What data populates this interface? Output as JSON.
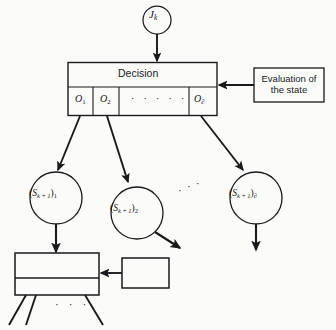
{
  "diagram": {
    "background_color": "#fbfbfa",
    "stroke_color": "#1a1a1d",
    "nodes": {
      "cost_node": {
        "label_base": "J",
        "label_sub": "k",
        "shape": "circle",
        "cx": 157,
        "cy": 20,
        "r": 14
      },
      "decision_box": {
        "header_label": "Decision",
        "cells": [
          {
            "base": "O",
            "sub": "1"
          },
          {
            "base": "O",
            "sub": "2"
          },
          {
            "base": "O",
            "sub": "∂"
          }
        ],
        "cells_ellipsis": "· · · · ·"
      },
      "evaluation_box": {
        "line1": "Evaluation of",
        "line2": "the state"
      },
      "state_nodes": [
        {
          "prefix": "(",
          "base": "S",
          "sub_inner": "k + 1",
          "close": ")",
          "sub_outer": "1"
        },
        {
          "prefix": "(",
          "base": "S",
          "sub_inner": "k + 1",
          "close": ")",
          "sub_outer": "2"
        },
        {
          "prefix": "(",
          "base": "S",
          "sub_inner": "k + 1",
          "close": ")",
          "sub_outer": "∂"
        }
      ],
      "lower_decision_box": {
        "label": "",
        "compartments": 2
      },
      "lower_eval_box": {
        "label": ""
      }
    },
    "ellipses": {
      "between_branches": "· · ·",
      "below_lower_box": "· · ·"
    }
  }
}
